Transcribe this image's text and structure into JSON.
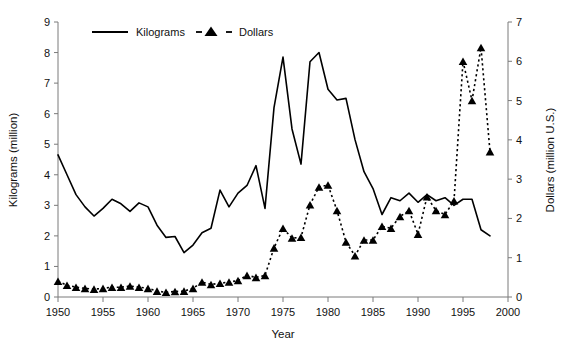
{
  "chart_data": {
    "type": "line",
    "title": "",
    "xlabel": "Year",
    "ylabel": "Kilograms (million)",
    "y2label": "Dollars (million U.S.)",
    "xlim": [
      1950,
      2000
    ],
    "ylim": [
      0,
      9
    ],
    "y2lim": [
      0,
      7
    ],
    "xticks": [
      1950,
      1955,
      1960,
      1965,
      1970,
      1975,
      1980,
      1985,
      1990,
      1995,
      2000
    ],
    "yticks": [
      0,
      1,
      2,
      3,
      4,
      5,
      6,
      7,
      8,
      9
    ],
    "y2ticks": [
      0,
      1,
      2,
      3,
      4,
      5,
      6,
      7
    ],
    "grid": false,
    "legend_position": "top-left-inside",
    "x": [
      1950,
      1951,
      1952,
      1953,
      1954,
      1955,
      1956,
      1957,
      1958,
      1959,
      1960,
      1961,
      1962,
      1963,
      1964,
      1965,
      1966,
      1967,
      1968,
      1969,
      1970,
      1971,
      1972,
      1973,
      1974,
      1975,
      1976,
      1977,
      1978,
      1979,
      1980,
      1981,
      1982,
      1983,
      1984,
      1985,
      1986,
      1987,
      1988,
      1989,
      1990,
      1991,
      1992,
      1993,
      1994,
      1995,
      1996,
      1997,
      1998
    ],
    "series": [
      {
        "name": "Kilograms",
        "axis": "left",
        "style": "solid-line",
        "marker": "none",
        "units": "million kilograms",
        "values": [
          4.65,
          4.0,
          3.35,
          2.95,
          2.65,
          2.9,
          3.2,
          3.05,
          2.8,
          3.08,
          2.95,
          2.35,
          1.95,
          1.98,
          1.45,
          1.7,
          2.1,
          2.25,
          3.5,
          2.95,
          3.4,
          3.65,
          4.3,
          2.9,
          6.2,
          7.85,
          5.5,
          4.35,
          7.7,
          8.0,
          6.8,
          6.45,
          6.5,
          5.15,
          4.1,
          3.55,
          2.7,
          3.25,
          3.15,
          3.4,
          3.1,
          3.35,
          3.15,
          3.25,
          3.0,
          3.2,
          3.2,
          2.2,
          2.0
        ]
      },
      {
        "name": "Dollars",
        "axis": "right",
        "style": "dashed-line",
        "marker": "triangle",
        "units": "million U.S. dollars",
        "values": [
          0.4,
          0.3,
          0.25,
          0.22,
          0.2,
          0.22,
          0.25,
          0.25,
          0.28,
          0.25,
          0.22,
          0.15,
          0.12,
          0.14,
          0.15,
          0.22,
          0.38,
          0.32,
          0.35,
          0.38,
          0.42,
          0.55,
          0.5,
          0.55,
          1.25,
          1.75,
          1.5,
          1.52,
          2.35,
          2.8,
          2.85,
          2.2,
          1.4,
          1.05,
          1.45,
          1.45,
          1.8,
          1.75,
          2.05,
          2.2,
          1.6,
          2.55,
          2.2,
          2.1,
          2.45,
          6.0,
          5.0,
          6.35,
          3.7
        ]
      }
    ]
  },
  "legend": {
    "items": [
      {
        "label": "Kilograms",
        "style": "solid-line"
      },
      {
        "label": "Dollars",
        "style": "dashed-triangle"
      }
    ]
  },
  "axes": {
    "x_title": "Year",
    "y_left_title": "Kilograms (million)",
    "y_right_title": "Dollars (million U.S.)"
  },
  "colors": {
    "line": "#000000",
    "axis": "#7a7a7a",
    "text": "#111111",
    "background": "#ffffff"
  }
}
